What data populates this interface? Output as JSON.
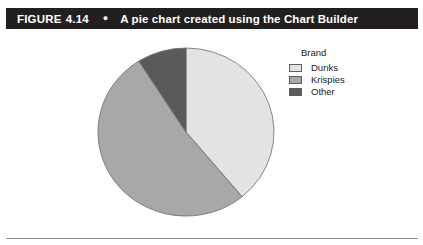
{
  "figure": {
    "label": "FIGURE",
    "number": "4.14",
    "bullet": "●",
    "caption": "A pie chart created using the Chart Builder"
  },
  "legend": {
    "title": "Brand",
    "items": [
      {
        "label": "Dunks",
        "color": "#e3e3e3"
      },
      {
        "label": "Krispies",
        "color": "#a8a8a8"
      },
      {
        "label": "Other",
        "color": "#5a5a5a"
      }
    ]
  },
  "chart_data": {
    "type": "pie",
    "title": "A pie chart created using the Chart Builder",
    "legend_title": "Brand",
    "legend_position": "right",
    "categories": [
      "Dunks",
      "Krispies",
      "Other"
    ],
    "values": [
      39,
      52,
      9
    ],
    "units": "percent",
    "colors": [
      "#e3e3e3",
      "#a8a8a8",
      "#5a5a5a"
    ],
    "start_angle_deg": 0,
    "direction": "clockwise",
    "slice_outline_color": "#6b6b6b",
    "grid": false,
    "xlabel": "",
    "ylabel": ""
  }
}
